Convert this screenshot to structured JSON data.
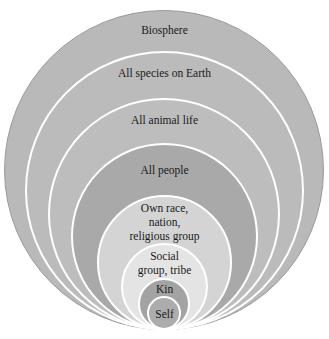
{
  "diagram": {
    "type": "nested-circles",
    "levels": [
      {
        "label": "Biosphere",
        "color": "#b9b9b9"
      },
      {
        "label": "All species on Earth",
        "color": "#bbbbbb"
      },
      {
        "label": "All animal life",
        "color": "#bdbdbd"
      },
      {
        "label": "All people",
        "color": "#a9a9a9"
      },
      {
        "label": "Own race,\nnation,\nreligious group",
        "line1": "Own race,",
        "line2": "nation,",
        "line3": "religious group",
        "color": "#d4d4d4"
      },
      {
        "label": "Social\ngroup, tribe",
        "line1": "Social",
        "line2": "group, tribe",
        "color": "#e4e4e4"
      },
      {
        "label": "Kin",
        "color": "#a3a3a3"
      },
      {
        "label": "Self",
        "color": "#acacac"
      }
    ],
    "border_color": "#ffffff"
  }
}
